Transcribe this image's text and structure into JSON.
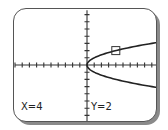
{
  "calculator_graph": {
    "function": "x = y^2",
    "window": {
      "xmin": -10,
      "xmax": 10,
      "ymin": -8,
      "ymax": 7.6,
      "xscl": 1,
      "yscl": 1
    },
    "cursor": {
      "x": 4,
      "y": 2
    },
    "readout": {
      "x_label": "X=4",
      "y_label": "Y=2"
    },
    "colors": {
      "curve": "#222222",
      "axes": "#333333",
      "frame": "#555555",
      "shadow": "#8a8a8a",
      "background": "#ffffff"
    }
  }
}
